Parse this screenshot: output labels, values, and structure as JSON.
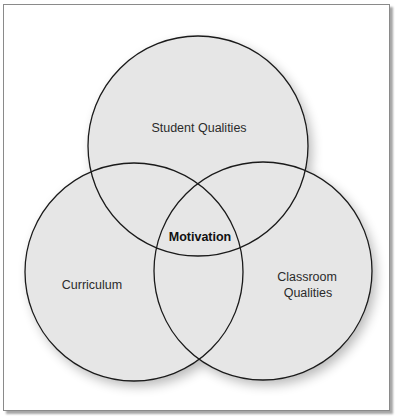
{
  "diagram": {
    "type": "venn",
    "colors": {
      "fill": "#e6e6e6",
      "stroke": "#1a1a1a",
      "frame_border": "#8a8a8a",
      "background": "#ffffff"
    },
    "sets": [
      {
        "id": "student",
        "label": "Student Qualities",
        "cx": 198,
        "cy": 146,
        "r": 110
      },
      {
        "id": "curriculum",
        "label": "Curriculum",
        "cx": 134,
        "cy": 272,
        "r": 109
      },
      {
        "id": "classroom",
        "label_line1": "Classroom",
        "label_line2": "Qualities",
        "cx": 263,
        "cy": 271,
        "r": 109
      }
    ],
    "intersection": {
      "label": "Motivation"
    }
  }
}
